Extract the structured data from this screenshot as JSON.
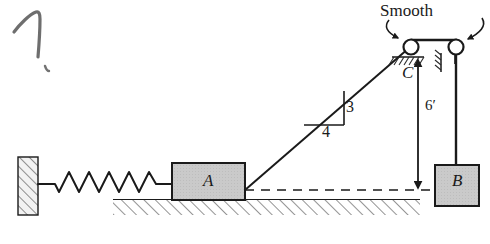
{
  "figure": {
    "annotation_scribble": "7",
    "labels": {
      "smooth": "Smooth",
      "block_a": "A",
      "block_b": "B",
      "point_c": "C",
      "height_dimension": "6′",
      "slope_rise": "3",
      "slope_run": "4"
    },
    "colors": {
      "block_fill": "#c9c9c9",
      "wall_fill": "#e8e8e8",
      "line": "#1a1a1a",
      "pencil": "#555555",
      "background": "#ffffff"
    },
    "elements": {
      "wall": "fixed hatched wall at left",
      "spring": "coil spring from wall to block A",
      "block_a": "gray block A resting on hatched ground",
      "ground": "hatched horizontal ground surface",
      "cable_a_to_c": "inclined cable from block A to pulley C, slope 3:4",
      "pulley_c": "smooth pulley at C",
      "pulley_right": "second smooth pulley on ceiling bracket",
      "cable_vertical": "vertical cable from right pulley to block B",
      "block_b": "gray hanging block B",
      "dashed_datum": "dashed horizontal reference line from A to B",
      "dimension_arrow": "double-headed vertical dimension arrow for 6 ft"
    }
  }
}
